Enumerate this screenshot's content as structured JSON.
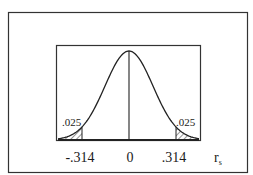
{
  "diagram": {
    "type": "sampling-distribution",
    "curve": "normal",
    "tail_labels": {
      "left": ".025",
      "right": ".025"
    },
    "x_ticks": [
      "-.314",
      "0",
      ".314"
    ],
    "axis_label": {
      "main": "r",
      "subscript": "s"
    },
    "colors": {
      "line": "#2a2a2a",
      "background": "#ffffff"
    }
  }
}
